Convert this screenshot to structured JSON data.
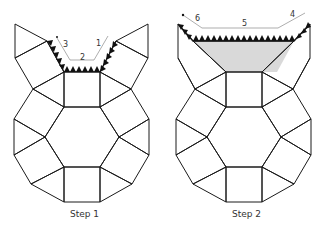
{
  "figures": [
    {
      "caption": "Step 1",
      "labels": [
        "1",
        "2",
        "3"
      ]
    },
    {
      "caption": "Step 2",
      "labels": [
        "4",
        "5",
        "6"
      ]
    }
  ],
  "colors": {
    "line": "#1a1a1a",
    "shaded_face": "#d9d9d9",
    "dimension": "#777777"
  }
}
